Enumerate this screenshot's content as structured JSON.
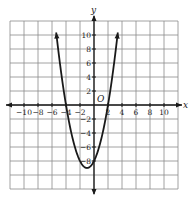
{
  "chart_data": {
    "type": "line",
    "title": "",
    "xlabel": "x",
    "ylabel": "y",
    "origin_label": "O",
    "xlim": [
      -12,
      12
    ],
    "ylim": [
      -12,
      12
    ],
    "grid": true,
    "grid_step": 2,
    "x_ticks": [
      -10,
      -8,
      -6,
      -4,
      -2,
      2,
      4,
      6,
      8,
      10
    ],
    "x_tick_labels": [
      "-10",
      "-8",
      "-6",
      "-4",
      "-2",
      "2",
      "4",
      "6",
      "8",
      "10"
    ],
    "y_ticks": [
      10,
      8,
      6,
      4,
      2,
      -2,
      -4,
      -6,
      -8
    ],
    "y_tick_labels": [
      "10",
      "8",
      "6",
      "4",
      "2",
      "-2",
      "-4",
      "-6",
      "-8"
    ],
    "series": [
      {
        "name": "parabola",
        "equation": "y = x^2 + 2x - 8",
        "x_range": [
          -5.4,
          3.4
        ],
        "vertex": [
          -1,
          -9
        ],
        "roots": [
          -4,
          2
        ],
        "y_intercept": -8,
        "arrows_at_ends": true,
        "color": "#1a1a1a"
      }
    ]
  },
  "colors": {
    "grid": "#8a8a8a",
    "axes": "#1a1a1a",
    "curve": "#1a1a1a"
  }
}
